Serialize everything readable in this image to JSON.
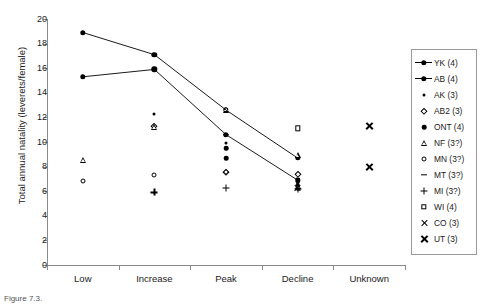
{
  "chart_data": {
    "type": "scatter",
    "title": "",
    "xlabel": "",
    "ylabel": "Total annual natality (leverets/female)",
    "categories": [
      "Low",
      "Increase",
      "Peak",
      "Decline",
      "Unknown"
    ],
    "ylim": [
      0,
      20
    ],
    "ytick_values": [
      0,
      2,
      4,
      6,
      8,
      10,
      12,
      14,
      16,
      18,
      20
    ],
    "ytick_labels": [
      "0",
      "2",
      "4",
      "6",
      "8",
      "10",
      "12",
      "14",
      "16",
      "18",
      "20"
    ],
    "grid": false,
    "legend_position": "right-outside",
    "series": [
      {
        "name": "YK (4)",
        "marker": "filled-circle-line",
        "connected": true,
        "points": [
          {
            "x": "Low",
            "y": 18.9
          },
          {
            "x": "Increase",
            "y": 17.1
          },
          {
            "x": "Peak",
            "y": 12.6
          },
          {
            "x": "Decline",
            "y": 8.7
          }
        ]
      },
      {
        "name": "AB (4)",
        "marker": "filled-circle-line",
        "connected": true,
        "points": [
          {
            "x": "Low",
            "y": 15.3
          },
          {
            "x": "Increase",
            "y": 15.9
          },
          {
            "x": "Peak",
            "y": 10.6
          },
          {
            "x": "Decline",
            "y": 6.9
          }
        ]
      },
      {
        "name": "AK (3)",
        "marker": "small-dot",
        "connected": false,
        "points": [
          {
            "x": "Increase",
            "y": 12.3
          },
          {
            "x": "Peak",
            "y": 9.9
          },
          {
            "x": "Decline",
            "y": 6.4
          }
        ]
      },
      {
        "name": "AB2 (3)",
        "marker": "open-diamond",
        "connected": false,
        "points": [
          {
            "x": "Increase",
            "y": 11.3
          },
          {
            "x": "Peak",
            "y": 7.6
          },
          {
            "x": "Decline",
            "y": 7.4
          }
        ]
      },
      {
        "name": "ONT (4)",
        "marker": "filled-circle",
        "connected": false,
        "points": [
          {
            "x": "Peak",
            "y": 9.5
          },
          {
            "x": "Peak",
            "y": 8.7
          },
          {
            "x": "Decline",
            "y": 6.5
          },
          {
            "x": "Decline",
            "y": 6.2
          }
        ]
      },
      {
        "name": "NF (3?)",
        "marker": "open-triangle",
        "connected": false,
        "points": [
          {
            "x": "Low",
            "y": 8.5
          },
          {
            "x": "Increase",
            "y": 11.7
          },
          {
            "x": "Peak",
            "y": 13.6
          },
          {
            "x": "Decline",
            "y": 10.4
          }
        ]
      },
      {
        "name": "MN (3?)",
        "marker": "open-circle",
        "connected": false,
        "points": [
          {
            "x": "Low",
            "y": 6.8
          },
          {
            "x": "Increase",
            "y": 7.3
          },
          {
            "x": "Peak",
            "y": 7.6
          },
          {
            "x": "Decline",
            "y": 6.3
          }
        ]
      },
      {
        "name": "MT (3?)",
        "marker": "dash",
        "connected": false,
        "points": [
          {
            "x": "Peak",
            "y": 10.6
          },
          {
            "x": "Decline",
            "y": 6.2
          }
        ]
      },
      {
        "name": "MI (3?)",
        "marker": "plus",
        "connected": false,
        "points": [
          {
            "x": "Increase",
            "y": 5.9
          },
          {
            "x": "Peak",
            "y": 6.3
          },
          {
            "x": "Decline",
            "y": 6.2
          }
        ]
      },
      {
        "name": "WI (4)",
        "marker": "open-square",
        "connected": false,
        "points": [
          {
            "x": "Decline",
            "y": 11.1
          }
        ]
      },
      {
        "name": "CO (3)",
        "marker": "x-thin",
        "connected": false,
        "points": [
          {
            "x": "Decline",
            "y": 6.3
          }
        ]
      },
      {
        "name": "UT (3)",
        "marker": "x-bold",
        "connected": false,
        "points": [
          {
            "x": "Unknown",
            "y": 11.3
          },
          {
            "x": "Unknown",
            "y": 8.0
          }
        ]
      }
    ]
  },
  "legend": {
    "entries": [
      {
        "label": "YK (4)",
        "marker": "filled-circle-line"
      },
      {
        "label": "AB (4)",
        "marker": "filled-circle-line"
      },
      {
        "label": "AK (3)",
        "marker": "small-dot"
      },
      {
        "label": "AB2 (3)",
        "marker": "open-diamond"
      },
      {
        "label": "ONT (4)",
        "marker": "filled-circle"
      },
      {
        "label": "NF (3?)",
        "marker": "open-triangle"
      },
      {
        "label": "MN (3?)",
        "marker": "open-circle"
      },
      {
        "label": "MT (3?)",
        "marker": "dash"
      },
      {
        "label": "MI (3?)",
        "marker": "plus"
      },
      {
        "label": "WI (4)",
        "marker": "open-square"
      },
      {
        "label": "CO (3)",
        "marker": "x-thin"
      },
      {
        "label": "UT (3)",
        "marker": "x-bold"
      }
    ]
  },
  "caption": "Figure 7.3.",
  "colors": {
    "axis": "#8a8a8a",
    "marker": "#000000",
    "text": "#1a1a1a"
  }
}
